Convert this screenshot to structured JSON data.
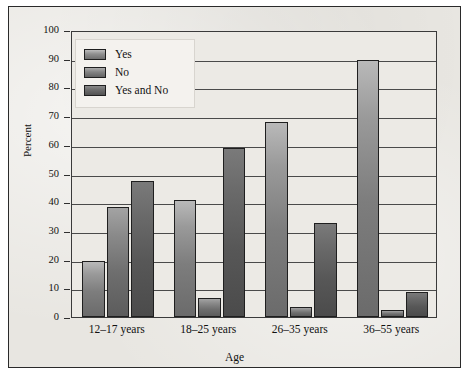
{
  "figure": {
    "background_color": "#e8e6e1",
    "frame_color": "#2a2a2a"
  },
  "chart_data": {
    "type": "bar",
    "title": "",
    "xlabel": "Age",
    "ylabel": "Percent",
    "categories": [
      "12–17 years",
      "18–25 years",
      "26–35 years",
      "36–55 years"
    ],
    "series": [
      {
        "name": "Yes",
        "color": "#8a8a8a",
        "values": [
          19.5,
          40.8,
          67.8,
          89.5
        ]
      },
      {
        "name": "No",
        "color": "#7a7a7a",
        "values": [
          38.5,
          6.5,
          3.5,
          2.5
        ]
      },
      {
        "name": "Yes and No",
        "color": "#5c5c5c",
        "values": [
          47.5,
          59.0,
          32.8,
          8.8
        ]
      }
    ],
    "ylim": [
      0,
      100
    ],
    "yticks": [
      0,
      10,
      20,
      30,
      40,
      50,
      60,
      70,
      80,
      90,
      100
    ],
    "ytick_labels": [
      "0",
      "10",
      "20",
      "30",
      "40",
      "50",
      "60",
      "70",
      "80",
      "90",
      "100"
    ],
    "grid": true,
    "grid_axis": "y",
    "legend_position": "upper left",
    "legend_entries": [
      "Yes",
      "No",
      "Yes and No"
    ]
  }
}
